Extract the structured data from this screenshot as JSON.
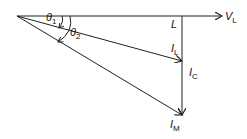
{
  "diagram": {
    "labels": {
      "theta1": "θ",
      "theta1_sub": "1",
      "theta2": "θ",
      "theta2_sub": "2",
      "L": "L",
      "VL": "V",
      "VL_sub": "L",
      "IL": "I",
      "IL_sub": "L",
      "IC": "I",
      "IC_sub": "C",
      "IM": "I",
      "IM_sub": "M"
    },
    "colors": {
      "line": "#222222"
    }
  }
}
